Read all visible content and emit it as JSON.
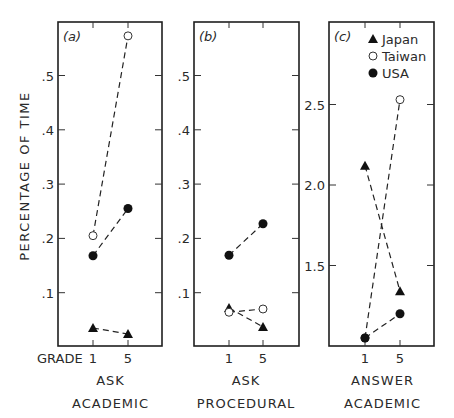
{
  "chart_data": {
    "type": "line",
    "title": "",
    "ylabel": "PERCENTAGE OF TIME",
    "xlabel_prefix": "GRADE",
    "x": [
      "1",
      "5"
    ],
    "legend": [
      {
        "name": "Japan",
        "marker": "filled-triangle"
      },
      {
        "name": "Taiwan",
        "marker": "open-circle"
      },
      {
        "name": "USA",
        "marker": "filled-circle"
      }
    ],
    "legend_position": "inside top of panel (c)",
    "grid": false,
    "panels": [
      {
        "tag": "(a)",
        "category": [
          "ASK",
          "ACADEMIC"
        ],
        "ylim": [
          0,
          0.6
        ],
        "yticks": [
          ".1",
          ".2",
          ".3",
          ".4",
          ".5"
        ],
        "ytick_values": [
          0.1,
          0.2,
          0.3,
          0.4,
          0.5
        ],
        "series": [
          {
            "name": "Japan",
            "values": [
              0.035,
              0.024
            ]
          },
          {
            "name": "Taiwan",
            "values": [
              0.205,
              0.573
            ]
          },
          {
            "name": "USA",
            "values": [
              0.168,
              0.255
            ]
          }
        ]
      },
      {
        "tag": "(b)",
        "category": [
          "ASK",
          "PROCEDURAL"
        ],
        "ylim": [
          0,
          0.6
        ],
        "yticks": [
          ".1",
          ".2",
          ".3",
          ".4",
          ".5"
        ],
        "ytick_values": [
          0.1,
          0.2,
          0.3,
          0.4,
          0.5
        ],
        "series": [
          {
            "name": "Japan",
            "values": [
              0.072,
              0.037
            ]
          },
          {
            "name": "Taiwan",
            "values": [
              0.064,
              0.07
            ]
          },
          {
            "name": "USA",
            "values": [
              0.169,
              0.227
            ]
          }
        ]
      },
      {
        "tag": "(c)",
        "category": [
          "ANSWER",
          "ACADEMIC"
        ],
        "ylim": [
          1.0,
          2.98
        ],
        "yticks": [
          "1.5",
          "2.0",
          "2.5"
        ],
        "ytick_values": [
          1.5,
          2.0,
          2.5
        ],
        "series": [
          {
            "name": "Japan",
            "values": [
              2.12,
              1.34
            ]
          },
          {
            "name": "Taiwan",
            "values": [
              1.05,
              2.53
            ]
          },
          {
            "name": "USA",
            "values": [
              1.05,
              1.2
            ]
          }
        ]
      }
    ]
  }
}
